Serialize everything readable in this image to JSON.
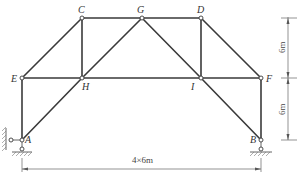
{
  "diagram": {
    "type": "truss",
    "nodes": {
      "A": {
        "label": "A"
      },
      "B": {
        "label": "B"
      },
      "C": {
        "label": "C"
      },
      "D": {
        "label": "D"
      },
      "E": {
        "label": "E"
      },
      "F": {
        "label": "F"
      },
      "G": {
        "label": "G"
      },
      "H": {
        "label": "H"
      },
      "I": {
        "label": "I"
      }
    },
    "members": [
      [
        "E",
        "C"
      ],
      [
        "C",
        "G"
      ],
      [
        "G",
        "D"
      ],
      [
        "D",
        "F"
      ],
      [
        "E",
        "H"
      ],
      [
        "H",
        "I"
      ],
      [
        "I",
        "F"
      ],
      [
        "C",
        "H"
      ],
      [
        "D",
        "I"
      ],
      [
        "H",
        "G"
      ],
      [
        "G",
        "I"
      ],
      [
        "E",
        "A"
      ],
      [
        "F",
        "B"
      ],
      [
        "A",
        "H"
      ],
      [
        "I",
        "B"
      ]
    ],
    "supports": {
      "A": "pin with horizontal and vertical links",
      "B": "roller"
    },
    "dimensions": {
      "horizontal": "4×6m",
      "vertical_top": "6m",
      "vertical_bottom": "6m"
    },
    "colors": {
      "member": "#3a3a3a",
      "dimension": "#666666"
    }
  }
}
